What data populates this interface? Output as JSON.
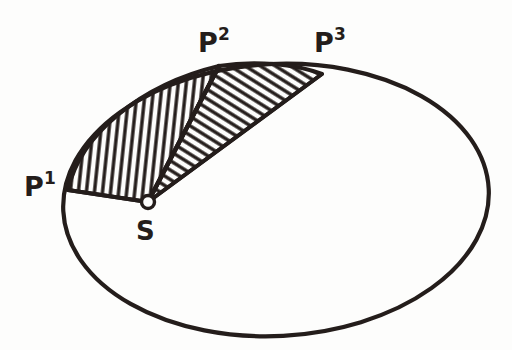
{
  "figure": {
    "background_color": "#fdfdfc",
    "ink_color": "#241d1b",
    "style": "hand-drawn ink line art",
    "orbit": {
      "name": "elliptical orbit outline",
      "center_x": 276,
      "center_y": 200,
      "radius_x": 213,
      "radius_y": 136,
      "rotation_deg": -3,
      "stroke_width": 4.2
    },
    "focus_marker": {
      "name": "sun focus point",
      "label": "S",
      "x": 148,
      "y": 202,
      "radius": 6.5,
      "filled": false
    },
    "points": [
      {
        "id": "p1",
        "base": "P",
        "superscript": "1",
        "label": "P1",
        "point_x": 68,
        "point_y": 190,
        "label_x": 24,
        "label_y": 196
      },
      {
        "id": "p2",
        "base": "P",
        "superscript": "2",
        "label": "P2",
        "point_x": 219,
        "point_y": 66,
        "label_x": 198,
        "label_y": 52
      },
      {
        "id": "p3",
        "base": "P",
        "superscript": "3",
        "label": "P3",
        "point_x": 322,
        "point_y": 74,
        "label_x": 314,
        "label_y": 52
      }
    ],
    "sectors": [
      {
        "id": "sector-1",
        "name": "swept area S-P1-P2",
        "vertices": [
          "S",
          "P1",
          "P2"
        ],
        "hatch_pattern": "vertical",
        "hatch_angle_deg": 84,
        "hatch_spacing": 8,
        "hatch_stroke_width": 3.4
      },
      {
        "id": "sector-2",
        "name": "swept area S-P2-P3",
        "vertices": [
          "S",
          "P2",
          "P3"
        ],
        "hatch_pattern": "diagonal",
        "hatch_angle_deg": 58,
        "hatch_spacing": 8,
        "hatch_stroke_width": 3.4
      }
    ]
  }
}
